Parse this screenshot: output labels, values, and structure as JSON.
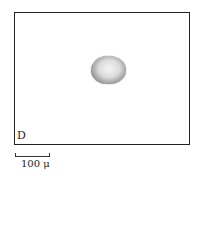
{
  "figure": {
    "panel_label": "D",
    "scale_bar": {
      "label": "100 μ",
      "length_px": 35
    },
    "specimen": {
      "shape": "ellipse",
      "description": "stippled dark-rimmed oval body, lighter center"
    }
  }
}
